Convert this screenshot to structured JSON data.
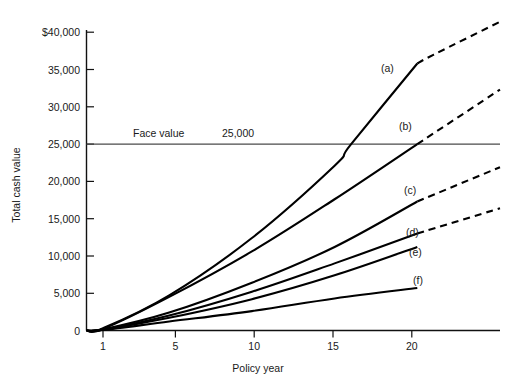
{
  "chart_data": {
    "type": "line",
    "title": "",
    "xlabel": "Policy year",
    "ylabel": "Total cash value",
    "xlim": [
      0,
      25
    ],
    "ylim": [
      0,
      40000
    ],
    "grid": false,
    "legend": "inline-curve-labels",
    "xticks": [
      1,
      5,
      10,
      15,
      20
    ],
    "xtick_labels": [
      "1",
      "5",
      "10",
      "15",
      "20"
    ],
    "yticks": [
      0,
      5000,
      10000,
      15000,
      20000,
      25000,
      30000,
      35000,
      40000
    ],
    "ytick_labels": [
      "0",
      "5,000",
      "10,000",
      "15,000",
      "20,000",
      "25,000",
      "30,000",
      "35,000",
      "$40,000"
    ],
    "annotations": [
      {
        "name": "face-value",
        "text": "Face value",
        "value_text": "25,000",
        "y": 25000
      }
    ],
    "reference_lines": [
      {
        "name": "face-value-line",
        "y": 25000,
        "color": "#4a4a4a"
      }
    ],
    "series": [
      {
        "name": "a",
        "label": "(a)",
        "solid_points": [
          [
            0,
            0
          ],
          [
            1,
            300
          ],
          [
            5,
            4700
          ],
          [
            10,
            12400
          ],
          [
            15,
            22100
          ],
          [
            16,
            25000
          ],
          [
            20,
            35800
          ]
        ],
        "dashed_points": [
          [
            20,
            35800
          ],
          [
            21,
            37000
          ],
          [
            25,
            41400
          ]
        ]
      },
      {
        "name": "b",
        "label": "(b)",
        "solid_points": [
          [
            0,
            0
          ],
          [
            1,
            200
          ],
          [
            5,
            4500
          ],
          [
            10,
            10600
          ],
          [
            15,
            17600
          ],
          [
            20,
            25000
          ]
        ],
        "dashed_points": [
          [
            20,
            25000
          ],
          [
            25,
            32300
          ]
        ]
      },
      {
        "name": "c",
        "label": "(c)",
        "solid_points": [
          [
            0,
            0
          ],
          [
            1,
            150
          ],
          [
            5,
            2400
          ],
          [
            10,
            6400
          ],
          [
            15,
            11200
          ],
          [
            20,
            17300
          ]
        ],
        "dashed_points": [
          [
            20,
            17300
          ],
          [
            25,
            21900
          ]
        ]
      },
      {
        "name": "d",
        "label": "(d)",
        "solid_points": [
          [
            0,
            0
          ],
          [
            1,
            120
          ],
          [
            5,
            2000
          ],
          [
            10,
            5200
          ],
          [
            15,
            9000
          ],
          [
            20,
            13000
          ]
        ],
        "dashed_points": [
          [
            20,
            13000
          ],
          [
            25,
            16400
          ]
        ]
      },
      {
        "name": "e",
        "label": "(e)",
        "solid_points": [
          [
            0,
            0
          ],
          [
            1,
            100
          ],
          [
            5,
            1700
          ],
          [
            10,
            4200
          ],
          [
            15,
            7400
          ],
          [
            20,
            11200
          ]
        ],
        "dashed_points": []
      },
      {
        "name": "f",
        "label": "(f)",
        "solid_points": [
          [
            0,
            0
          ],
          [
            1,
            80
          ],
          [
            5,
            1200
          ],
          [
            10,
            2600
          ],
          [
            15,
            4300
          ],
          [
            20,
            5700
          ]
        ],
        "dashed_points": []
      }
    ]
  },
  "labels": {
    "y_axis_title": "Total cash value",
    "x_axis_title": "Policy year",
    "face_value_text": "Face value",
    "face_value_number": "25,000",
    "curve_a": "(a)",
    "curve_b": "(b)",
    "curve_c": "(c)",
    "curve_d": "(d)",
    "curve_e": "(e)",
    "curve_f": "(f)",
    "y0": "0",
    "y5": "5,000",
    "y10": "10,000",
    "y15": "15,000",
    "y20": "20,000",
    "y25": "25,000",
    "y30": "30,000",
    "y35": "35,000",
    "y40": "$40,000",
    "x1": "1",
    "x5": "5",
    "x10": "10",
    "x15": "15",
    "x20": "20"
  },
  "colors": {
    "curve": "#000000",
    "axis": "#111111",
    "reference_line": "#4a4a4a",
    "text": "#1a1a1a",
    "background": "#ffffff"
  }
}
